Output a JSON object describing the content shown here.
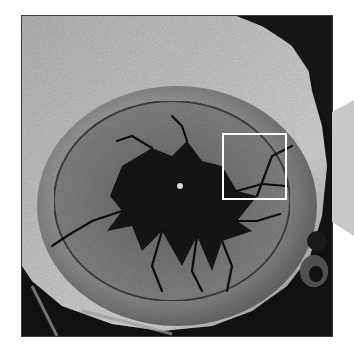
{
  "figure": {
    "image_region": {
      "x": 22,
      "y": 16,
      "width": 310,
      "height": 320
    },
    "highlight_box": {
      "x": 222,
      "y": 133,
      "width": 63,
      "height": 65,
      "color": "#ffffff",
      "label": "magnified region"
    },
    "callout": {
      "shape": "trapezoid",
      "color": "#c8c8c8",
      "direction": "right"
    },
    "colors": {
      "background": "#ffffff",
      "sample_dark": "#0e0e0e",
      "sample_mid": "#6a6a6a",
      "sample_light": "#b8b8b8"
    }
  }
}
